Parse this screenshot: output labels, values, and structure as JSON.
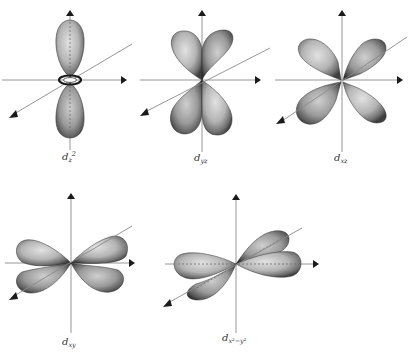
{
  "figure": {
    "title": "",
    "orbitals": [
      {
        "id": "dz2",
        "label_main": "d",
        "label_sub": "z",
        "label_sup": "2",
        "label_text": "d_z²",
        "shape": "two lobes along z with torus in xy-plane"
      },
      {
        "id": "dyz",
        "label_main": "d",
        "label_sub": "yz",
        "label_sup": "",
        "label_text": "d_yz",
        "shape": "four lobes between y and z axes"
      },
      {
        "id": "dxz",
        "label_main": "d",
        "label_sub": "xz",
        "label_sup": "",
        "label_text": "d_xz",
        "shape": "four lobes between x and z axes"
      },
      {
        "id": "dxy",
        "label_main": "d",
        "label_sub": "xy",
        "label_sup": "",
        "label_text": "d_xy",
        "shape": "four lobes between x and y axes"
      },
      {
        "id": "dx2y2",
        "label_main": "d",
        "label_sub": "x²−y²",
        "label_sup": "",
        "label_text": "d_x²−y²",
        "shape": "four lobes along x and y axes"
      }
    ]
  },
  "colors": {
    "lobe_light": "#d8d8d8",
    "lobe_mid": "#a8a8a8",
    "lobe_dark": "#4a4a4a",
    "axis": "#8a8a8a",
    "arrowhead": "#1a1a1a",
    "background": "#ffffff"
  }
}
